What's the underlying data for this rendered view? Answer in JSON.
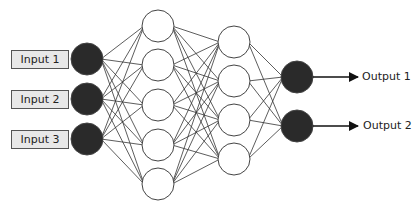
{
  "diagram": {
    "type": "neural-network",
    "inputs": [
      {
        "label": "Input 1"
      },
      {
        "label": "Input 2"
      },
      {
        "label": "Input 3"
      }
    ],
    "outputs": [
      {
        "label": "Output 1"
      },
      {
        "label": "Output 2"
      }
    ],
    "layers": [
      {
        "name": "input",
        "nodes": 3,
        "fill": "#2a2a2a"
      },
      {
        "name": "hidden-1",
        "nodes": 5,
        "fill": "#ffffff"
      },
      {
        "name": "hidden-2",
        "nodes": 4,
        "fill": "#ffffff"
      },
      {
        "name": "output",
        "nodes": 2,
        "fill": "#2a2a2a"
      }
    ],
    "colors": {
      "edge": "#333333",
      "box_fill": "#e8e8e8",
      "node_stroke": "#444444"
    }
  }
}
